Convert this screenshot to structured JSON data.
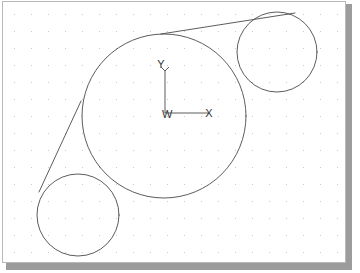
{
  "app": {
    "title": "CAD Sketch View",
    "background_color": "#ffffff",
    "shadow_color": "#9c9c9c"
  },
  "canvas": {
    "name": "drawing-canvas",
    "width": 344,
    "height": 262,
    "background_color": "#ffffff",
    "border_color": "#b8b8b8",
    "grid": {
      "visible": true,
      "style": "dotted",
      "spacing": 17,
      "origin_x": 11,
      "origin_y": 12,
      "dot_color": "#c9c4cc",
      "dot_radius": 0.55
    }
  },
  "geometry": {
    "stroke_color": "#4a4a4a",
    "stroke_width": 0.9,
    "circles": [
      {
        "id": "main-circle",
        "label": "Main Circle",
        "cx": 161,
        "cy": 114,
        "r": 82
      },
      {
        "id": "upper-right-circle",
        "label": "Upper Right Circle",
        "cx": 274,
        "cy": 50,
        "r": 40
      },
      {
        "id": "lower-left-circle",
        "label": "Lower Left Circle",
        "cx": 75,
        "cy": 213,
        "r": 41
      }
    ],
    "tangent_lines": [
      {
        "id": "tangent-upper",
        "label": "Upper Tangent Line",
        "x1": 158,
        "y1": 32,
        "x2": 292,
        "y2": 11
      },
      {
        "id": "tangent-lower",
        "label": "Lower Tangent Line",
        "x1": 78,
        "y1": 99,
        "x2": 36,
        "y2": 190
      }
    ]
  },
  "coordinate_system": {
    "name": "wcs-triad",
    "origin_x": 162,
    "origin_y": 111,
    "y_axis_length": 42,
    "x_axis_length": 44,
    "arrow_size": 4,
    "labels": {
      "y": "Y",
      "x": "X",
      "origin": "W"
    },
    "label_positions": {
      "y": {
        "x": 158,
        "y": 66
      },
      "x": {
        "x": 206,
        "y": 115
      },
      "origin": {
        "x": 159,
        "y": 116
      }
    }
  }
}
